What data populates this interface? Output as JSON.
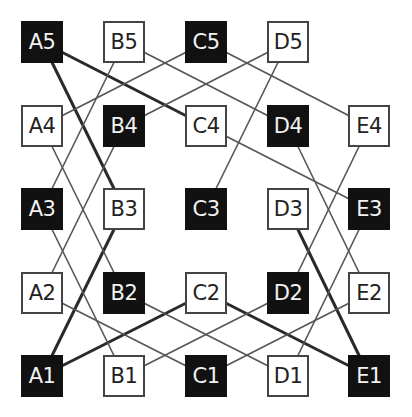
{
  "diagram": {
    "grid": {
      "columns": [
        "A",
        "B",
        "C",
        "D",
        "E"
      ],
      "rows": [
        5,
        4,
        3,
        2,
        1
      ],
      "col_x": [
        21,
        103,
        185,
        267,
        348
      ],
      "row_y": {
        "5": 21,
        "4": 105,
        "3": 188,
        "2": 272,
        "1": 355
      },
      "box_size": 42
    },
    "nodes": [
      {
        "id": "A5",
        "label": "A5",
        "dark": true
      },
      {
        "id": "B5",
        "label": "B5",
        "dark": false
      },
      {
        "id": "C5",
        "label": "C5",
        "dark": true
      },
      {
        "id": "D5",
        "label": "D5",
        "dark": false
      },
      {
        "id": "A4",
        "label": "A4",
        "dark": false
      },
      {
        "id": "B4",
        "label": "B4",
        "dark": true
      },
      {
        "id": "C4",
        "label": "C4",
        "dark": false
      },
      {
        "id": "D4",
        "label": "D4",
        "dark": true
      },
      {
        "id": "E4",
        "label": "E4",
        "dark": false
      },
      {
        "id": "A3",
        "label": "A3",
        "dark": true
      },
      {
        "id": "B3",
        "label": "B3",
        "dark": false
      },
      {
        "id": "C3",
        "label": "C3",
        "dark": true
      },
      {
        "id": "D3",
        "label": "D3",
        "dark": false
      },
      {
        "id": "E3",
        "label": "E3",
        "dark": true
      },
      {
        "id": "A2",
        "label": "A2",
        "dark": false
      },
      {
        "id": "B2",
        "label": "B2",
        "dark": true
      },
      {
        "id": "C2",
        "label": "C2",
        "dark": false
      },
      {
        "id": "D2",
        "label": "D2",
        "dark": true
      },
      {
        "id": "E2",
        "label": "E2",
        "dark": false
      },
      {
        "id": "A1",
        "label": "A1",
        "dark": true
      },
      {
        "id": "B1",
        "label": "B1",
        "dark": false
      },
      {
        "id": "C1",
        "label": "C1",
        "dark": true
      },
      {
        "id": "D1",
        "label": "D1",
        "dark": false
      },
      {
        "id": "E1",
        "label": "E1",
        "dark": true
      }
    ],
    "edges": [
      {
        "from": "A5",
        "to": "C4",
        "thick": true
      },
      {
        "from": "A5",
        "to": "B3",
        "thick": true
      },
      {
        "from": "B3",
        "to": "A1",
        "thick": true
      },
      {
        "from": "A1",
        "to": "C2",
        "thick": true
      },
      {
        "from": "C2",
        "to": "E1",
        "thick": true
      },
      {
        "from": "D3",
        "to": "E1",
        "thick": true
      },
      {
        "from": "B5",
        "to": "A3",
        "thick": false
      },
      {
        "from": "C5",
        "to": "A4",
        "thick": false
      },
      {
        "from": "B5",
        "to": "D4",
        "thick": false
      },
      {
        "from": "D5",
        "to": "B4",
        "thick": false
      },
      {
        "from": "C5",
        "to": "E4",
        "thick": false
      },
      {
        "from": "D5",
        "to": "C3",
        "thick": false
      },
      {
        "from": "A4",
        "to": "B2",
        "thick": false
      },
      {
        "from": "B4",
        "to": "A2",
        "thick": false
      },
      {
        "from": "A3",
        "to": "B1",
        "thick": false
      },
      {
        "from": "A2",
        "to": "C1",
        "thick": false
      },
      {
        "from": "B2",
        "to": "D1",
        "thick": false
      },
      {
        "from": "B1",
        "to": "D2",
        "thick": false
      },
      {
        "from": "C4",
        "to": "E3",
        "thick": false
      },
      {
        "from": "D4",
        "to": "E2",
        "thick": false
      },
      {
        "from": "E4",
        "to": "D2",
        "thick": false
      },
      {
        "from": "E3",
        "to": "D1",
        "thick": false
      },
      {
        "from": "C1",
        "to": "E2",
        "thick": false
      }
    ],
    "colors": {
      "dark_fill": "#111111",
      "light_fill": "#ffffff",
      "thick_edge": "#2a2a2a",
      "thin_edge": "#555555"
    }
  }
}
